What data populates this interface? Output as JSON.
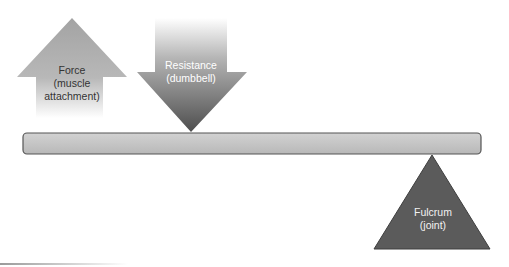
{
  "diagram": {
    "type": "lever",
    "force": {
      "line1": "Force",
      "line2": "(muscle",
      "line3": "attachment)",
      "direction": "up",
      "color": "#a9a9a9",
      "text_color": "#333333"
    },
    "resistance": {
      "line1": "Resistance",
      "line2": "(dumbbell)",
      "direction": "down",
      "color": "#6e6e6e",
      "text_color": "#ffffff"
    },
    "lever_bar": {
      "fill": "#c4c4c4",
      "stroke": "#5a5a5a"
    },
    "fulcrum": {
      "line1": "Fulcrum",
      "line2": "(joint)",
      "fill": "#5b5b5b",
      "text_color": "#f2f2f2"
    }
  }
}
